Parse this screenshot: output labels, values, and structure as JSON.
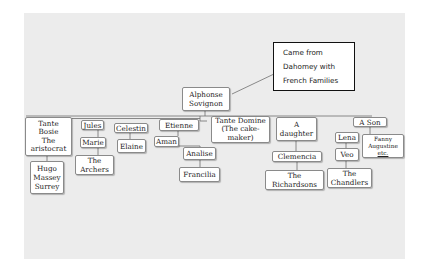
{
  "diagram": {
    "type": "family-tree",
    "note": {
      "lines": [
        "Came from",
        "Dahomey with",
        "French Families"
      ]
    },
    "root": {
      "lines": [
        "Alphonse",
        "Sovignon"
      ]
    },
    "nodes": {
      "tante_bosie": {
        "lines": [
          "Tante",
          "Bosie",
          "The",
          "aristocrat"
        ]
      },
      "hugo": {
        "lines": [
          "Hugo",
          "Massey",
          "Surrey"
        ]
      },
      "jules": {
        "lines": [
          "Jules"
        ]
      },
      "marie": {
        "lines": [
          "Marie"
        ]
      },
      "archers": {
        "lines": [
          "The",
          "Archers"
        ]
      },
      "celestin": {
        "lines": [
          "Celestin"
        ]
      },
      "elaine": {
        "lines": [
          "Elaine"
        ]
      },
      "etienne": {
        "lines": [
          "Etienne"
        ]
      },
      "aman": {
        "lines": [
          "Aman"
        ]
      },
      "analise": {
        "lines": [
          "Analise"
        ]
      },
      "francilia": {
        "lines": [
          "Francilia"
        ]
      },
      "tante_domine": {
        "lines": [
          "Tante Domine",
          "(The cake-",
          "maker)"
        ]
      },
      "a_daughter": {
        "lines": [
          "A",
          "daughter"
        ]
      },
      "clemencia": {
        "lines": [
          "Clemencia"
        ]
      },
      "richardsons": {
        "lines": [
          "The",
          "Richardsons"
        ]
      },
      "a_son": {
        "lines": [
          "A Son"
        ]
      },
      "lena": {
        "lines": [
          "Lena"
        ]
      },
      "veo": {
        "lines": [
          "Veo"
        ]
      },
      "chandlers": {
        "lines": [
          "The",
          "Chandlers"
        ]
      },
      "fanny": {
        "lines": [
          "Fanny",
          "Augustine",
          "etc."
        ]
      }
    }
  }
}
